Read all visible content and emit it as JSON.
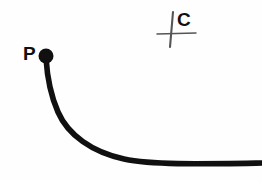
{
  "figure": {
    "background_color": "#fefefe",
    "ink_color": "#101010",
    "cross_color": "#555555",
    "width": 262,
    "height": 181,
    "labels": [
      {
        "id": "P",
        "text": "P",
        "x": 23,
        "y": 44,
        "role": "point-label",
        "description": "label for the filled start point of the curve"
      },
      {
        "id": "C",
        "text": "C",
        "x": 177,
        "y": 10,
        "role": "point-label",
        "description": "label for the cross / center marker"
      }
    ],
    "point_marker": {
      "name": "point-p-dot",
      "cx": 46,
      "cy": 56,
      "r": 7.5,
      "fill": "#101010",
      "description": "solid filled dot marking point P"
    },
    "cross_marker": {
      "name": "center-mark-c",
      "vertical": {
        "x1": 173,
        "y1": 12,
        "x2": 170,
        "y2": 47,
        "stroke_width": 2.1
      },
      "horizontal": {
        "x1": 157,
        "y1": 34,
        "x2": 196,
        "y2": 33,
        "stroke_width": 1.5
      },
      "description": "small hand-drawn cross (plus sign) marking center C"
    },
    "curve": {
      "name": "arc-path-p-to-right-edge",
      "stroke": "#101010",
      "stroke_width": 5.6,
      "start": {
        "x": 46,
        "y": 58
      },
      "end": {
        "x": 262,
        "y": 163
      },
      "path": "M 46 58 C 47 74, 50 94, 58 112 C 68 135, 92 152, 124 159 C 152 165, 200 164, 262 163",
      "description": "thick curve leaving point P downward, bending right and flattening to a horizontal tail at the right edge"
    }
  }
}
